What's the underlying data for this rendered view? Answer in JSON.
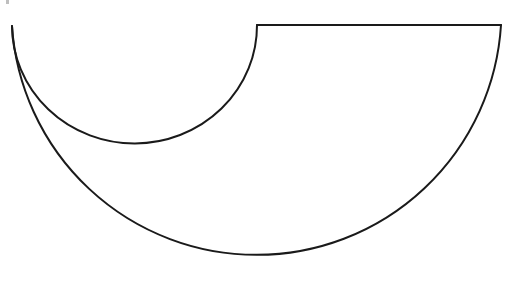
{
  "diagram": {
    "title": "",
    "colors": {
      "background": "#ffffff",
      "stroke": "#1a1a1a"
    },
    "shapes": {
      "outer_arc": {
        "start": [
          12,
          26
        ],
        "end": [
          501,
          25
        ],
        "radius": 245
      },
      "inner_arc": {
        "start": [
          12,
          26
        ],
        "end": [
          257,
          25
        ],
        "radius": 122
      },
      "top_edge": {
        "start": [
          257,
          25
        ],
        "end": [
          501,
          25
        ]
      }
    }
  }
}
